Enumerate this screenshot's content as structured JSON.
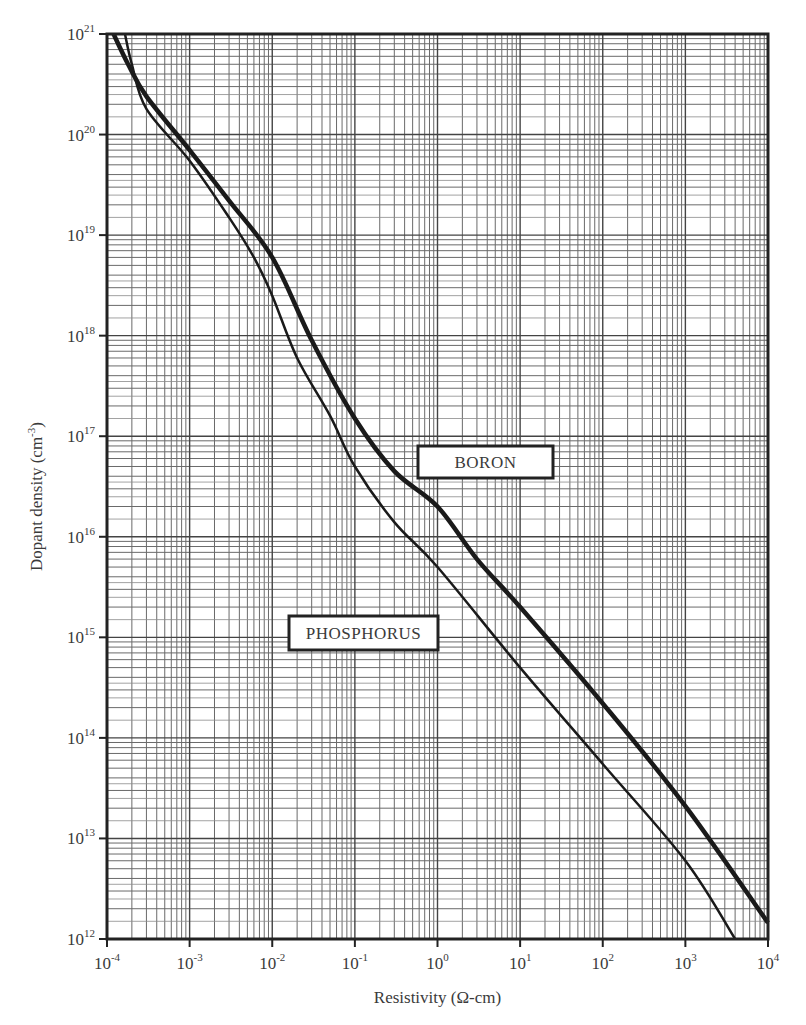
{
  "chart_data": {
    "type": "line",
    "title": "",
    "xlabel": "Resistivity (Ω-cm)",
    "ylabel": "Dopant density (cm⁻³)",
    "ylabel_base": "Dopant density (cm",
    "ylabel_sup": "-3",
    "ylabel_close": ")",
    "xscale": "log",
    "yscale": "log",
    "xlim": [
      0.0001,
      10000
    ],
    "ylim": [
      1000000000000.0,
      1e+21
    ],
    "grid": true,
    "x_ticks": [
      {
        "base": "10",
        "exp": "-4",
        "value": 0.0001
      },
      {
        "base": "10",
        "exp": "-3",
        "value": 0.001
      },
      {
        "base": "10",
        "exp": "-2",
        "value": 0.01
      },
      {
        "base": "10",
        "exp": "-1",
        "value": 0.1
      },
      {
        "base": "10",
        "exp": "0",
        "value": 1
      },
      {
        "base": "10",
        "exp": "1",
        "value": 10
      },
      {
        "base": "10",
        "exp": "2",
        "value": 100
      },
      {
        "base": "10",
        "exp": "3",
        "value": 1000
      },
      {
        "base": "10",
        "exp": "4",
        "value": 10000
      }
    ],
    "y_ticks": [
      {
        "base": "10",
        "exp": "12",
        "value": 1000000000000.0
      },
      {
        "base": "10",
        "exp": "13",
        "value": 10000000000000.0
      },
      {
        "base": "10",
        "exp": "14",
        "value": 100000000000000.0
      },
      {
        "base": "10",
        "exp": "15",
        "value": 1000000000000000.0
      },
      {
        "base": "10",
        "exp": "16",
        "value": 1e+16
      },
      {
        "base": "10",
        "exp": "17",
        "value": 1e+17
      },
      {
        "base": "10",
        "exp": "18",
        "value": 1e+18
      },
      {
        "base": "10",
        "exp": "19",
        "value": 1e+19
      },
      {
        "base": "10",
        "exp": "20",
        "value": 1e+20
      },
      {
        "base": "10",
        "exp": "21",
        "value": 1e+21
      }
    ],
    "series": [
      {
        "name": "BORON",
        "line_width": 4.5,
        "color": "#1a1a1a",
        "x": [
          0.00012,
          0.00018,
          0.0003,
          0.001,
          0.003,
          0.01,
          0.03,
          0.1,
          0.3,
          1,
          3,
          10,
          100,
          1000,
          10000
        ],
        "y": [
          1e+21,
          5e+20,
          2.4e+20,
          7e+19,
          2.2e+19,
          6e+18,
          9e+17,
          1.5e+17,
          4.5e+16,
          2e+16,
          6000000000000000.0,
          2000000000000000.0,
          220000000000000.0,
          21000000000000.0,
          1450000000000.0
        ]
      },
      {
        "name": "PHOSPHORUS",
        "line_width": 2.5,
        "color": "#1a1a1a",
        "x": [
          0.000165,
          0.0002,
          0.0003,
          0.001,
          0.003,
          0.006,
          0.01,
          0.02,
          0.05,
          0.1,
          0.3,
          1,
          10,
          100,
          1000,
          4000
        ],
        "y": [
          1e+21,
          5e+20,
          1.8e+20,
          5.5e+19,
          1.5e+19,
          6e+18,
          2.5e+18,
          6e+17,
          1.6e+17,
          5e+16,
          1.4e+16,
          5000000000000000.0,
          500000000000000.0,
          55000000000000.0,
          6000000000000.0,
          1000000000000.0
        ]
      }
    ],
    "annotations": [
      {
        "text": "BORON",
        "x": 0.5,
        "y": 6e+16,
        "box": true
      },
      {
        "text": "PHOSPHORUS",
        "x": 0.03,
        "y": 1300000000000000.0,
        "box": true
      }
    ],
    "legend": "none"
  }
}
